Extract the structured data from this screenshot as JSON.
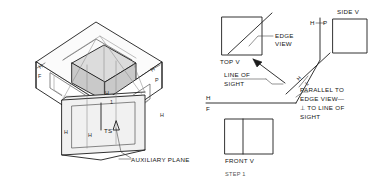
{
  "figure": {
    "title": "STEP 1",
    "step_label": "STEP 1"
  },
  "isometric": {
    "callout_label": "AUXILIARY PLANE",
    "true_shape_label": "TS",
    "fold_labels": {
      "h_left": "H",
      "f_left": "F",
      "h_right": "H",
      "p_right": "P",
      "h_front_top": "H",
      "h_front_left": "H",
      "h_left_wall": "H",
      "h_right_wall": "H",
      "one_label": "1"
    }
  },
  "ortho": {
    "top_view_label": "TOP V",
    "front_view_label": "FRONT V",
    "side_view_label": "SIDE V",
    "edge_view_label_line1": "EDGE",
    "edge_view_label_line2": "VIEW",
    "line_of_sight_line1": "LINE OF",
    "line_of_sight_line2": "SIGHT",
    "note_line1": "PARALLEL TO",
    "note_line2": "EDGE VIEW—",
    "note_line3": "⊥ TO LINE OF",
    "note_line4": "SIGHT",
    "fold_hf_h": "H",
    "fold_hf_f": "F",
    "fold_hp_h": "H",
    "fold_hp_p": "P",
    "fold_aux_h": "H",
    "fold_aux_1": "1"
  },
  "colors": {
    "ink": "#1c1c1c",
    "thin_ink": "#3a3a3a",
    "faint_ink": "#8a8a8a",
    "solid_fill": "#c9c9c9",
    "panel_fill": "#f1f1f1",
    "background": "#ffffff"
  }
}
